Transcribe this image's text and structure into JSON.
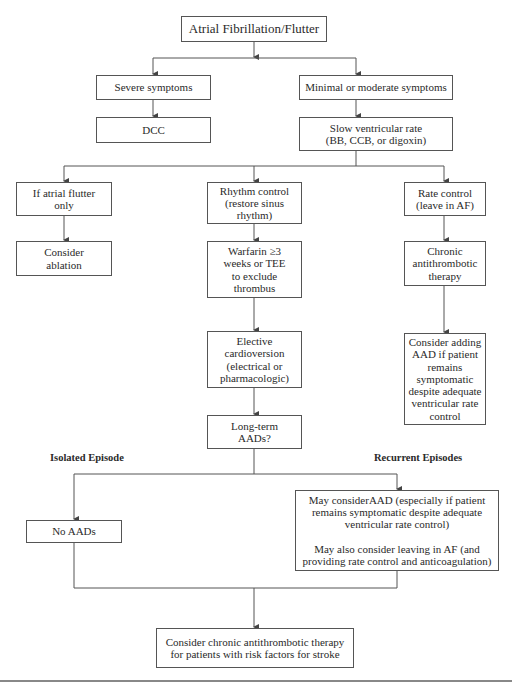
{
  "diagram": {
    "title": "Atrial Fibrillation/Flutter",
    "nodes": {
      "severe": "Severe symptoms",
      "dcc": "DCC",
      "minimal": "Minimal or moderate symptoms",
      "slow_rate": "Slow ventricular rate\n(BB, CCB, or digoxin)",
      "flutter_only": "If atrial flutter\nonly",
      "ablation": "Consider\nablation",
      "rhythm_control": "Rhythm control\n(restore sinus\nrhythm)",
      "warfarin": "Warfarin ≥3\nweeks or TEE\nto exclude\nthrombus",
      "cardioversion": "Elective\ncardioversion\n(electrical or\npharmacologic)",
      "long_term": "Long-term\nAADs?",
      "rate_control": "Rate control\n(leave in AF)",
      "chronic_antithrombotic": "Chronic\nantithrombotic\ntherapy",
      "consider_adding_aad": "Consider adding\nAAD if patient\nremains\nsymptomatic\ndespite adequate\nventricular rate\ncontrol",
      "no_aads": "No AADs",
      "recurrent_box": "May considerAAD (especially if patient\nremains symptomatic despite adequate\nventricular rate control)\n\nMay also consider leaving in AF (and\nproviding rate control and anticoagulation)",
      "final": "Consider chronic antithrombotic therapy\nfor patients with risk factors for stroke"
    },
    "labels": {
      "isolated": "Isolated Episode",
      "recurrent": "Recurrent Episodes"
    },
    "colors": {
      "line": "#555555",
      "text": "#2a2a2a",
      "background": "#ffffff"
    }
  }
}
